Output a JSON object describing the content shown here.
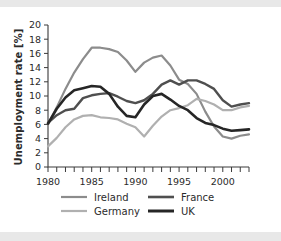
{
  "figure": {
    "background_color": "#ffffff",
    "band_color": "#e8e8e8"
  },
  "chart_data": {
    "type": "line",
    "title": "",
    "xlabel": "",
    "ylabel": "Unemployment rate [%]",
    "xlim": [
      1980,
      2003
    ],
    "ylim": [
      0,
      20
    ],
    "xticks": [
      1980,
      1981,
      1982,
      1983,
      1984,
      1985,
      1986,
      1987,
      1988,
      1989,
      1990,
      1991,
      1992,
      1993,
      1994,
      1995,
      1996,
      1997,
      1998,
      1999,
      2000,
      2001,
      2002,
      2003
    ],
    "xtick_labels": [
      "1980",
      "1985",
      "1990",
      "1995",
      "2000"
    ],
    "xtick_label_values": [
      1980,
      1985,
      1990,
      1995,
      2000
    ],
    "yticks": [
      0,
      2,
      4,
      6,
      8,
      10,
      12,
      14,
      16,
      18,
      20
    ],
    "ytick_labels": [
      "0",
      "2",
      "4",
      "6",
      "8",
      "10",
      "12",
      "14",
      "16",
      "18",
      "20"
    ],
    "grid": false,
    "legend_position": "below-axes",
    "x": [
      1980,
      1981,
      1982,
      1983,
      1984,
      1985,
      1986,
      1987,
      1988,
      1989,
      1990,
      1991,
      1992,
      1993,
      1994,
      1995,
      1996,
      1997,
      1998,
      1999,
      2000,
      2001,
      2002,
      2003
    ],
    "series": [
      {
        "name": "Ireland",
        "color": "#8c8c8c",
        "width": 2.2,
        "values": [
          6.0,
          8.4,
          11.0,
          13.3,
          15.2,
          16.8,
          16.8,
          16.6,
          16.2,
          15.0,
          13.4,
          14.7,
          15.4,
          15.7,
          14.3,
          12.3,
          11.7,
          10.3,
          7.8,
          5.7,
          4.3,
          4.0,
          4.4,
          4.6
        ]
      },
      {
        "name": "France",
        "color": "#4f4f4f",
        "width": 2.4,
        "values": [
          6.2,
          7.3,
          8.0,
          8.2,
          9.7,
          10.1,
          10.3,
          10.4,
          9.9,
          9.3,
          9.0,
          9.4,
          10.3,
          11.6,
          12.2,
          11.6,
          12.2,
          12.2,
          11.7,
          11.0,
          9.4,
          8.5,
          8.8,
          9.0
        ]
      },
      {
        "name": "Germany",
        "color": "#b0b0b0",
        "width": 2.2,
        "values": [
          2.9,
          4.1,
          5.6,
          6.7,
          7.2,
          7.3,
          7.0,
          6.9,
          6.7,
          6.1,
          5.6,
          4.3,
          5.8,
          7.1,
          8.0,
          8.3,
          8.7,
          9.6,
          9.3,
          8.8,
          8.0,
          8.0,
          8.4,
          8.6
        ]
      },
      {
        "name": "UK",
        "color": "#262626",
        "width": 2.6,
        "values": [
          6.1,
          8.2,
          9.8,
          10.8,
          11.1,
          11.4,
          11.3,
          10.3,
          8.5,
          7.2,
          7.0,
          8.8,
          10.0,
          10.3,
          9.5,
          8.6,
          8.0,
          6.9,
          6.2,
          5.9,
          5.4,
          5.1,
          5.2,
          5.3
        ]
      }
    ]
  },
  "legend": {
    "entries": [
      {
        "label": "Ireland",
        "color": "#8c8c8c",
        "width": 2.2
      },
      {
        "label": "France",
        "color": "#4f4f4f",
        "width": 2.6
      },
      {
        "label": "Germany",
        "color": "#b0b0b0",
        "width": 2.2
      },
      {
        "label": "UK",
        "color": "#262626",
        "width": 3.0
      }
    ]
  }
}
